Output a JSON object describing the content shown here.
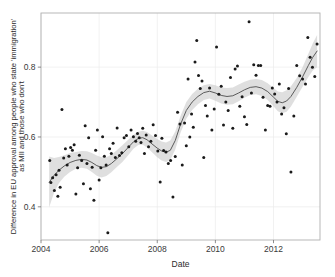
{
  "chart_data": {
    "type": "scatter",
    "title": "",
    "subtitle": "",
    "xlabel": "Date",
    "ylabel": "Difference in EU approval among people who state 'immigration' as MII and those who don't",
    "ylabel_lines": [
      "Difference in EU approval among people who state 'immigration'",
      "as MII and those who don't"
    ],
    "xlim": [
      2004.0,
      2013.6
    ],
    "ylim": [
      0.305,
      0.955
    ],
    "xticks": [
      2004,
      2006,
      2008,
      2010,
      2012
    ],
    "xtick_labels": [
      "2004",
      "2006",
      "2008",
      "2010",
      "2012"
    ],
    "yticks": [
      0.4,
      0.6,
      0.8
    ],
    "ytick_labels": [
      "0.4",
      "0.6",
      "0.8"
    ],
    "grid": true,
    "grid_color": "#ebebeb",
    "legend": "none",
    "point_color": "#1a1a1a",
    "point_size": 1.5,
    "line_color": "#4c4c4c",
    "band_color": "#cccccc",
    "band_opacity": 0.62,
    "panel_background": "#ffffff",
    "panel_border_color": "#b0b0b0",
    "series": [
      {
        "name": "observations",
        "type": "scatter",
        "x": [
          2004.3,
          2004.34,
          2004.4,
          2004.46,
          2004.52,
          2004.58,
          2004.62,
          2004.66,
          2004.72,
          2004.78,
          2004.84,
          2004.9,
          2004.96,
          2005.02,
          2005.08,
          2005.14,
          2005.2,
          2005.26,
          2005.32,
          2005.4,
          2005.46,
          2005.52,
          2005.58,
          2005.64,
          2005.7,
          2005.76,
          2005.82,
          2005.88,
          2005.94,
          2006.0,
          2006.06,
          2006.12,
          2006.18,
          2006.24,
          2006.3,
          2006.36,
          2006.42,
          2006.48,
          2006.56,
          2006.62,
          2006.7,
          2006.78,
          2006.86,
          2006.94,
          2007.02,
          2007.1,
          2007.18,
          2007.26,
          2007.32,
          2007.38,
          2007.44,
          2007.5,
          2007.56,
          2007.62,
          2007.7,
          2007.78,
          2007.86,
          2007.94,
          2008.02,
          2008.1,
          2008.16,
          2008.22,
          2008.3,
          2008.38,
          2008.46,
          2008.54,
          2008.62,
          2008.7,
          2008.78,
          2008.86,
          2008.94,
          2009.0,
          2009.06,
          2009.12,
          2009.18,
          2009.24,
          2009.3,
          2009.36,
          2009.42,
          2009.48,
          2009.54,
          2009.6,
          2009.66,
          2009.72,
          2009.8,
          2009.88,
          2009.96,
          2010.04,
          2010.12,
          2010.2,
          2010.28,
          2010.36,
          2010.44,
          2010.52,
          2010.6,
          2010.68,
          2010.76,
          2010.84,
          2010.92,
          2011.0,
          2011.08,
          2011.16,
          2011.24,
          2011.32,
          2011.4,
          2011.48,
          2011.56,
          2011.64,
          2011.72,
          2011.8,
          2011.88,
          2011.96,
          2012.04,
          2012.12,
          2012.2,
          2012.28,
          2012.36,
          2012.44,
          2012.52,
          2012.6,
          2012.7,
          2012.8,
          2012.9,
          2013.0,
          2013.1,
          2013.18,
          2013.26,
          2013.34,
          2013.42,
          2013.5
        ],
        "y": [
          0.533,
          0.47,
          0.483,
          0.447,
          0.492,
          0.43,
          0.505,
          0.456,
          0.679,
          0.54,
          0.566,
          0.52,
          0.545,
          0.57,
          0.562,
          0.578,
          0.437,
          0.512,
          0.548,
          0.533,
          0.466,
          0.632,
          0.524,
          0.598,
          0.452,
          0.513,
          0.419,
          0.562,
          0.62,
          0.477,
          0.512,
          0.601,
          0.545,
          0.52,
          0.326,
          0.566,
          0.553,
          0.582,
          0.541,
          0.626,
          0.547,
          0.555,
          0.598,
          0.604,
          0.572,
          0.62,
          0.601,
          0.588,
          0.61,
          0.598,
          0.584,
          0.625,
          0.553,
          0.606,
          0.572,
          0.588,
          0.635,
          0.604,
          0.56,
          0.471,
          0.596,
          0.561,
          0.557,
          0.524,
          0.533,
          0.428,
          0.544,
          0.671,
          0.637,
          0.52,
          0.64,
          0.575,
          0.766,
          0.6,
          0.666,
          0.628,
          0.815,
          0.876,
          0.776,
          0.739,
          0.76,
          0.541,
          0.69,
          0.66,
          0.74,
          0.62,
          0.68,
          0.858,
          0.722,
          0.745,
          0.634,
          0.7,
          0.676,
          0.77,
          0.625,
          0.795,
          0.803,
          0.688,
          0.715,
          0.658,
          0.636,
          0.93,
          0.726,
          0.807,
          0.777,
          0.805,
          0.805,
          0.714,
          0.62,
          0.69,
          0.688,
          0.74,
          0.723,
          0.7,
          0.752,
          0.666,
          0.684,
          0.609,
          0.739,
          0.5,
          0.66,
          0.805,
          0.775,
          0.766,
          0.752,
          0.885,
          0.828,
          0.8,
          0.773,
          0.866
        ]
      },
      {
        "name": "loess-fit",
        "type": "line",
        "x": [
          2004.28,
          2004.45,
          2004.62,
          2004.8,
          2005.0,
          2005.2,
          2005.4,
          2005.58,
          2005.75,
          2005.92,
          2006.08,
          2006.25,
          2006.42,
          2006.6,
          2006.8,
          2007.0,
          2007.18,
          2007.35,
          2007.5,
          2007.65,
          2007.82,
          2008.0,
          2008.15,
          2008.3,
          2008.45,
          2008.62,
          2008.8,
          2009.0,
          2009.2,
          2009.4,
          2009.6,
          2009.8,
          2010.0,
          2010.2,
          2010.4,
          2010.6,
          2010.8,
          2011.0,
          2011.2,
          2011.4,
          2011.6,
          2011.8,
          2012.0,
          2012.15,
          2012.3,
          2012.45,
          2012.6,
          2012.8,
          2013.0,
          2013.2,
          2013.35,
          2013.5
        ],
        "y": [
          0.47,
          0.49,
          0.505,
          0.517,
          0.527,
          0.533,
          0.536,
          0.534,
          0.527,
          0.518,
          0.513,
          0.515,
          0.524,
          0.537,
          0.552,
          0.57,
          0.586,
          0.596,
          0.598,
          0.592,
          0.58,
          0.568,
          0.56,
          0.556,
          0.562,
          0.59,
          0.636,
          0.676,
          0.7,
          0.716,
          0.727,
          0.731,
          0.726,
          0.719,
          0.716,
          0.718,
          0.726,
          0.735,
          0.742,
          0.744,
          0.74,
          0.73,
          0.714,
          0.702,
          0.698,
          0.703,
          0.716,
          0.742,
          0.772,
          0.805,
          0.828,
          0.846
        ],
        "lower": [
          0.398,
          0.441,
          0.468,
          0.486,
          0.5,
          0.509,
          0.512,
          0.509,
          0.5,
          0.489,
          0.484,
          0.488,
          0.499,
          0.513,
          0.528,
          0.548,
          0.566,
          0.577,
          0.578,
          0.57,
          0.556,
          0.542,
          0.533,
          0.528,
          0.534,
          0.564,
          0.612,
          0.652,
          0.677,
          0.694,
          0.706,
          0.71,
          0.704,
          0.696,
          0.692,
          0.694,
          0.702,
          0.712,
          0.72,
          0.722,
          0.717,
          0.706,
          0.688,
          0.674,
          0.668,
          0.672,
          0.687,
          0.715,
          0.744,
          0.772,
          0.79,
          0.8
        ],
        "upper": [
          0.544,
          0.54,
          0.543,
          0.548,
          0.554,
          0.557,
          0.56,
          0.559,
          0.554,
          0.547,
          0.542,
          0.542,
          0.549,
          0.561,
          0.576,
          0.592,
          0.606,
          0.615,
          0.618,
          0.614,
          0.604,
          0.594,
          0.587,
          0.584,
          0.59,
          0.616,
          0.66,
          0.7,
          0.723,
          0.738,
          0.748,
          0.752,
          0.748,
          0.742,
          0.74,
          0.742,
          0.75,
          0.758,
          0.764,
          0.766,
          0.763,
          0.754,
          0.74,
          0.73,
          0.728,
          0.734,
          0.745,
          0.769,
          0.8,
          0.838,
          0.868,
          0.892
        ]
      }
    ]
  }
}
